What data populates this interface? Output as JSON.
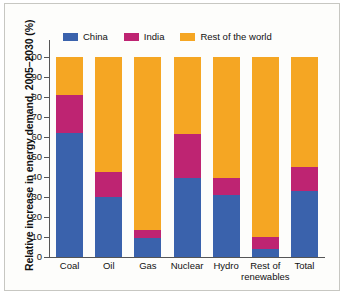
{
  "chart_data": {
    "type": "bar",
    "stacked": true,
    "title": "",
    "subtitle": "",
    "xlabel": "",
    "ylabel": "Relative increase in energy demand, 2005–2030 (%)",
    "ylim": [
      0,
      100
    ],
    "yticks": [
      0,
      10,
      20,
      30,
      40,
      50,
      60,
      70,
      80,
      90,
      100
    ],
    "ytick_labels": [
      "0",
      "10",
      "20",
      "30",
      "40",
      "50",
      "60",
      "70",
      "80",
      "90",
      "100"
    ],
    "grid": false,
    "legend_position": "top-left",
    "categories": [
      "Coal",
      "Oil",
      "Gas",
      "Nuclear",
      "Hydro",
      "Rest of renewables",
      "Total"
    ],
    "category_labels": [
      [
        "Coal"
      ],
      [
        "Oil"
      ],
      [
        "Gas"
      ],
      [
        "Nuclear"
      ],
      [
        "Hydro"
      ],
      [
        "Rest of",
        "renewables"
      ],
      [
        "Total"
      ]
    ],
    "series": [
      {
        "name": "China",
        "color": "#3A62AC",
        "values": [
          62,
          30,
          9.5,
          39.5,
          31,
          4,
          33
        ]
      },
      {
        "name": "India",
        "color": "#BE2472",
        "values": [
          19,
          12.5,
          4,
          22,
          8.5,
          6,
          12
        ]
      },
      {
        "name": "Rest of the world",
        "color": "#F5A623",
        "values": [
          19,
          57.5,
          86.5,
          38.5,
          60.5,
          90,
          55
        ]
      }
    ],
    "cumulative_tops": {
      "china": [
        62,
        30,
        9.5,
        39.5,
        31,
        4,
        33
      ],
      "india": [
        81,
        42.5,
        13.5,
        61.5,
        39.5,
        10,
        45
      ],
      "world": [
        100,
        100,
        100,
        100,
        100,
        100,
        100
      ]
    }
  },
  "legend": {
    "items": [
      {
        "label": "China",
        "color": "#3A62AC"
      },
      {
        "label": "India",
        "color": "#BE2472"
      },
      {
        "label": "Rest of the world",
        "color": "#F5A623"
      }
    ]
  },
  "colors": {
    "china": "#3A62AC",
    "india": "#BE2472",
    "world": "#F5A623",
    "axis": "#555555",
    "text": "#111111",
    "plot_background": "#fdfdfb",
    "page_background": "#ffffff",
    "page_shadow": "#cfcfc9",
    "border": "#c7c7c2"
  }
}
